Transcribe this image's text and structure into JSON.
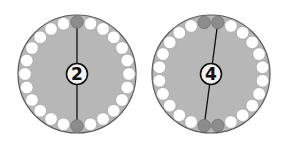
{
  "colors": {
    "disk_fill": "#b7b7b7",
    "disk_stroke": "#5a5a5a",
    "dot_white": "#ffffff",
    "dot_white_stroke": "#9a9a9a",
    "dot_gray": "#8c8c8c",
    "dot_gray_stroke": "#6a6a6a",
    "line": "#111111",
    "badge_fill": "#f2f2f2",
    "badge_stroke": "#111111",
    "badge_text": "#111111"
  },
  "diagrams": [
    {
      "id": "circle-2",
      "label": "2",
      "center": [
        77,
        74
      ],
      "radius": 59,
      "dot_count": 24,
      "dot_ring_radius": 52,
      "dot_radius": 6.3,
      "angle_offset_deg": 0,
      "gray_dot_indices": [
        0,
        12
      ],
      "line_from_index": 0,
      "line_to_index": 12
    },
    {
      "id": "circle-4",
      "label": "4",
      "center": [
        211,
        74
      ],
      "radius": 59,
      "dot_count": 24,
      "dot_ring_radius": 52,
      "dot_radius": 6.3,
      "angle_offset_deg": 7.5,
      "gray_dot_indices": [
        0,
        23,
        11,
        12
      ],
      "line_from_index": 0,
      "line_to_index": 12
    }
  ]
}
